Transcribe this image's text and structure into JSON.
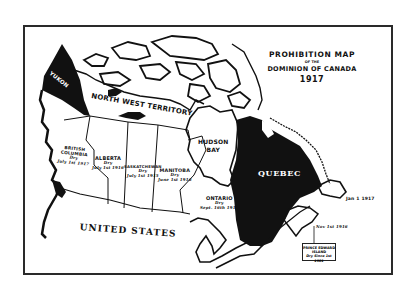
{
  "map": {
    "title": {
      "line1": "PROHIBITION MAP",
      "line2": "OF THE",
      "line3": "DOMINION OF CANADA",
      "year": "1917"
    },
    "regions": {
      "yukon": {
        "name": "YUKON",
        "status": "wet"
      },
      "nwt": {
        "name": "NORTH WEST TERRITORY"
      },
      "british_columbia": {
        "name_line1": "BRITISH",
        "name_line2": "COLUMBIA",
        "status": "Dry",
        "date": "July 1st 1917"
      },
      "alberta": {
        "name": "ALBERTA",
        "status": "Dry",
        "date": "July 1st 1916"
      },
      "saskatchewan": {
        "name": "SASKATCHEWAN",
        "status": "Dry",
        "date": "July 1st 1915"
      },
      "manitoba": {
        "name": "MANITOBA",
        "status": "Dry",
        "date": "June 1st 1916"
      },
      "hudson_bay": {
        "name_line1": "HUDSON",
        "name_line2": "BAY"
      },
      "ontario": {
        "name": "ONTARIO",
        "status": "Dry",
        "date": "Sept. 16th 1916"
      },
      "quebec": {
        "name": "QUEBEC",
        "status": "wet"
      },
      "maritimes": {
        "date_new_brunswick": "May 1st 1917",
        "date_nova_scotia": "Nov 1st 1916"
      },
      "newfoundland": {
        "date": "Jan 1 1917"
      },
      "pei": {
        "name_line1": "PRINCE EDWARD",
        "name_line2": "ISLAND",
        "status_date": "Dry Since 1st 1901"
      },
      "united_states": {
        "name": "UNITED STATES"
      }
    },
    "colors": {
      "ink": "#111111",
      "paper": "#ffffff",
      "frame": "#2a2a2a"
    }
  }
}
